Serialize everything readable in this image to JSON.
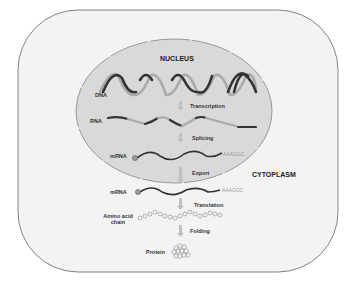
{
  "diagram": {
    "regions": {
      "nucleus": "NUCLEUS",
      "cytoplasm": "CYTOPLASM"
    },
    "molecules": {
      "dna": "DNA",
      "rna": "RNA",
      "mrna_nucleus": "mRNA",
      "mrna_cytoplasm": "mRNA",
      "amino_acid_chain": "Amino acid chain",
      "protein": "Protein"
    },
    "steps": {
      "transcription": "Transcription",
      "splicing": "Splicing",
      "export": "Export",
      "translation": "Translation",
      "folding": "Folding"
    },
    "sequences": {
      "poly_a_nucleus": "AAAGGC",
      "poly_a_cytoplasm": "AAAGGC"
    },
    "colors": {
      "cell_fill": "#f3f3f3",
      "cell_stroke": "#666666",
      "nucleus_fill": "#d9d9d9",
      "strand_dark": "#333333",
      "strand_light": "#aaaaaa",
      "arrow": "#c0c0c0"
    }
  }
}
